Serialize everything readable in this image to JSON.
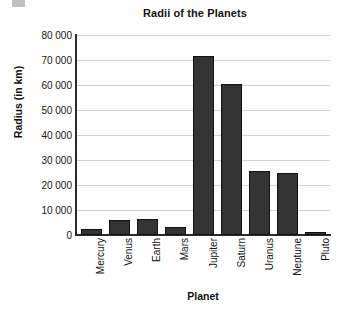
{
  "chart_data": {
    "type": "bar",
    "title": "Radii of the Planets",
    "xlabel": "Planet",
    "ylabel": "Radius (in km)",
    "categories": [
      "Mercury",
      "Venus",
      "Earth",
      "Mars",
      "Jupiter",
      "Saturn",
      "Uranus",
      "Neptune",
      "Pluto"
    ],
    "values": [
      2440,
      6050,
      6400,
      3400,
      71500,
      60300,
      25600,
      24800,
      1200
    ],
    "ylim": [
      0,
      80000
    ],
    "ytick_labels": [
      "80 000",
      "70 000",
      "60 000",
      "50 000",
      "40 000",
      "30 000",
      "20 000",
      "10 000",
      "0"
    ],
    "ytick_values": [
      80000,
      70000,
      60000,
      50000,
      40000,
      30000,
      20000,
      10000,
      0
    ],
    "grid": true,
    "legend": false,
    "bar_color": "#333333",
    "grid_color": "#d2d2d2",
    "axis_color": "#2b2b2b"
  }
}
